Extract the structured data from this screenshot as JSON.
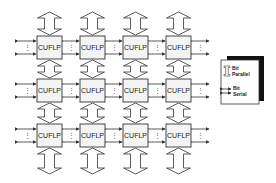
{
  "diagram": {
    "type": "processor-array",
    "rows": 3,
    "cols": 4,
    "node_label": "CUFLP",
    "nodes": [
      [
        "CUFLP",
        "CUFLP",
        "CUFLP",
        "CUFLP"
      ],
      [
        "CUFLP",
        "CUFLP",
        "CUFLP",
        "CUFLP"
      ],
      [
        "CUFLP",
        "CUFLP",
        "CUFLP",
        "CUFLP"
      ]
    ],
    "vertical_links": "bit-parallel",
    "horizontal_links": "bit-serial",
    "ellipsis": "⋮"
  },
  "legend": {
    "items": [
      {
        "icon": "hollow-double-arrow-icon",
        "label_line1": "Bit",
        "label_line2": "Parallel"
      },
      {
        "icon": "double-line-arrow-icon",
        "label_line1": "Bit",
        "label_line2": "Serial"
      }
    ]
  },
  "colors": {
    "line": "#333333",
    "box_fill": "#f4f4f4",
    "background": "#ffffff",
    "shadow": "#111111"
  }
}
